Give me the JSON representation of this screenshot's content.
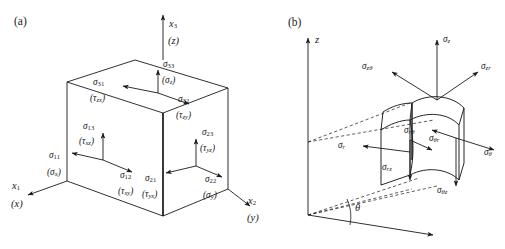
{
  "figure": {
    "panels": [
      {
        "id": "(a)",
        "name": "cartesian",
        "description": "Cubic element with stress components in Cartesian coordinates",
        "axes": [
          {
            "name": "x3",
            "index_label": "x",
            "index_sub": "3",
            "alt_label": "(z)",
            "direction": "up"
          },
          {
            "name": "x1",
            "index_label": "x",
            "index_sub": "1",
            "alt_label": "(x)",
            "direction": "down-left"
          },
          {
            "name": "x2",
            "index_label": "x",
            "index_sub": "2",
            "alt_label": "(y)",
            "direction": "down-right"
          }
        ],
        "faces": [
          {
            "face": "top",
            "normal": "3",
            "components": [
              {
                "index": "33",
                "sigma": "σ",
                "sub": "33",
                "alt": "(σ",
                "alt_sub": "z",
                "alt_close": ")",
                "direction": "up"
              },
              {
                "index": "31",
                "sigma": "σ",
                "sub": "31",
                "alt": "(τ",
                "alt_sub": "zx",
                "alt_close": ")",
                "direction": "left"
              },
              {
                "index": "32",
                "sigma": "σ",
                "sub": "32",
                "alt": "(τ",
                "alt_sub": "zy",
                "alt_close": ")",
                "direction": "right"
              }
            ]
          },
          {
            "face": "left",
            "normal": "1",
            "components": [
              {
                "index": "13",
                "sigma": "σ",
                "sub": "13",
                "alt": "(τ",
                "alt_sub": "xz",
                "alt_close": ")",
                "direction": "up"
              },
              {
                "index": "11",
                "sigma": "σ",
                "sub": "11",
                "alt": "(σ",
                "alt_sub": "x",
                "alt_close": ")",
                "direction": "left"
              },
              {
                "index": "12",
                "sigma": "σ",
                "sub": "12",
                "alt": "(τ",
                "alt_sub": "xy",
                "alt_close": ")",
                "direction": "right"
              }
            ]
          },
          {
            "face": "right",
            "normal": "2",
            "components": [
              {
                "index": "23",
                "sigma": "σ",
                "sub": "23",
                "alt": "(τ",
                "alt_sub": "yz",
                "alt_close": ")",
                "direction": "up"
              },
              {
                "index": "21",
                "sigma": "σ",
                "sub": "21",
                "alt": "(τ",
                "alt_sub": "yx",
                "alt_close": ")",
                "direction": "left"
              },
              {
                "index": "22",
                "sigma": "σ",
                "sub": "22",
                "alt": "(σ",
                "alt_sub": "y",
                "alt_close": ")",
                "direction": "right"
              }
            ]
          }
        ]
      },
      {
        "id": "(b)",
        "name": "cylindrical",
        "description": "Curved wedge element with stress components in cylindrical coordinates",
        "axes": [
          {
            "name": "z",
            "index_label": "z",
            "direction": "up"
          }
        ],
        "angle": {
          "symbol": "θ",
          "name": "theta-angle"
        },
        "components": [
          {
            "name": "sigma-z",
            "sigma": "σ",
            "sub": "z",
            "direction": "up"
          },
          {
            "name": "sigma-z-theta",
            "sigma": "σ",
            "sub": "zθ",
            "direction": "up-left"
          },
          {
            "name": "sigma-z-r",
            "sigma": "σ",
            "sub": "zr",
            "direction": "up-right"
          },
          {
            "name": "sigma-r",
            "sigma": "σ",
            "sub": "r",
            "direction": "left"
          },
          {
            "name": "sigma-r-theta",
            "sigma": "σ",
            "sub": "rθ",
            "direction": "down-right"
          },
          {
            "name": "sigma-r-z",
            "sigma": "σ",
            "sub": "rz",
            "direction": "down"
          },
          {
            "name": "sigma-theta-r",
            "sigma": "σ",
            "sub": "θr",
            "direction": "down-left"
          },
          {
            "name": "sigma-theta",
            "sigma": "σ",
            "sub": "θ",
            "direction": "right"
          },
          {
            "name": "sigma-theta-z",
            "sigma": "σ",
            "sub": "θz",
            "direction": "down"
          }
        ]
      }
    ],
    "colors": {
      "background": "#ffffff",
      "stroke": "#1a1a1a",
      "text": "#1a1a1a"
    }
  }
}
